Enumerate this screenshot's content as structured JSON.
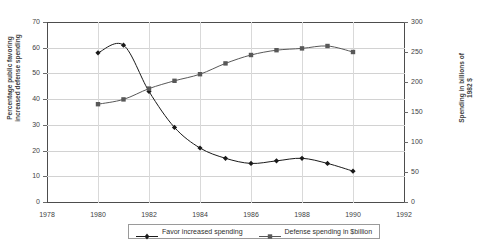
{
  "chart_data": {
    "type": "line",
    "title": "PERCEPTIONS AND THE POLITICS OF DEFENSE",
    "x": [
      1980,
      1981,
      1982,
      1983,
      1984,
      1985,
      1986,
      1987,
      1988,
      1989,
      1990
    ],
    "xlabel": "",
    "xlim": [
      1978,
      1992
    ],
    "xticks": [
      "1978",
      "1980",
      "1982",
      "1984",
      "1986",
      "1988",
      "1990",
      "1992"
    ],
    "xtick_values": [
      1978,
      1980,
      1982,
      1984,
      1986,
      1988,
      1990,
      1992
    ],
    "grid": true,
    "legend_position": "bottom-center",
    "axes": [
      {
        "id": "left",
        "ylabel": "Percentage public favoring increased defense spending",
        "ylim": [
          0,
          70
        ],
        "yticks": [
          "0",
          "10",
          "20",
          "30",
          "40",
          "50",
          "60",
          "70"
        ],
        "ytick_values": [
          0,
          10,
          20,
          30,
          40,
          50,
          60,
          70
        ]
      },
      {
        "id": "right",
        "ylabel": "Spending in billions of 1982 $",
        "ylim": [
          0,
          300
        ],
        "yticks": [
          "0",
          "50",
          "100",
          "150",
          "200",
          "250",
          "300"
        ],
        "ytick_values": [
          0,
          50,
          100,
          150,
          200,
          250,
          300
        ]
      }
    ],
    "series": [
      {
        "name": "Favor increased spending",
        "axis": "left",
        "marker": "diamond",
        "color": "#1a1a1a",
        "x": [
          1980,
          1981,
          1982,
          1983,
          1984,
          1985,
          1986,
          1987,
          1988,
          1989,
          1990
        ],
        "values": [
          58,
          61,
          43,
          29,
          21,
          17,
          15,
          16,
          17,
          15,
          12
        ]
      },
      {
        "name": "Defense spending in $billion",
        "axis": "right",
        "marker": "square",
        "color": "#585858",
        "x": [
          1980,
          1981,
          1982,
          1983,
          1984,
          1985,
          1986,
          1987,
          1988,
          1989,
          1990
        ],
        "values": [
          163,
          171,
          189,
          202,
          213,
          231,
          245,
          253,
          256,
          260,
          250
        ]
      }
    ]
  },
  "chart": {
    "title": "PERCEPTIONS AND THE POLITICS OF DEFENSE",
    "left_axis_title": "Percentage public favoring\nincreased defense spending",
    "right_axis_title": "Spending in billions of\n1982 $"
  },
  "legend": {
    "items": [
      {
        "label": "Favor increased spending",
        "marker": "diamond-marker",
        "color": "#1a1a1a"
      },
      {
        "label": "Defense spending in $billion",
        "marker": "square-marker",
        "color": "#585858"
      }
    ]
  }
}
